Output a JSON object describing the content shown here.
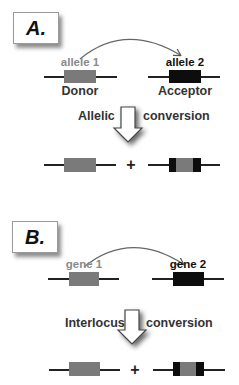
{
  "colors": {
    "donor_gray": "#7a7a7a",
    "acceptor_black": "#0d0d0d",
    "donor_label": "#8a8a8a",
    "acceptor_label": "#111111",
    "line": "#222222"
  },
  "panels": [
    {
      "label": "A.",
      "source_label": "allele 1",
      "target_label": "allele 2",
      "source_caption": "Donor",
      "target_caption": "Acceptor",
      "process_left": "Allelic",
      "process_right": "conversion",
      "plus": "+"
    },
    {
      "label": "B.",
      "source_label": "gene 1",
      "target_label": "gene 2",
      "process_left": "Interlocus",
      "process_right": "conversion",
      "plus": "+"
    }
  ]
}
